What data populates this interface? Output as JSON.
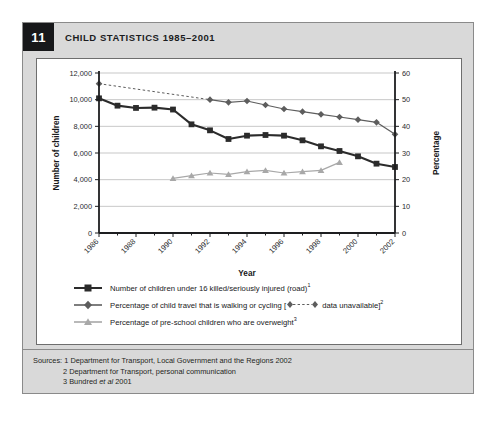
{
  "figure": {
    "number": "11",
    "title": "CHILD STATISTICS 1985–2001"
  },
  "chart_data": {
    "type": "line",
    "title": "",
    "xlabel": "Year",
    "ylabel": "Number of children",
    "y2label": "Percentage",
    "x": [
      1986,
      1987,
      1988,
      1989,
      1990,
      1991,
      1992,
      1993,
      1994,
      1995,
      1996,
      1997,
      1998,
      1999,
      2000,
      2001,
      2002
    ],
    "xlim": [
      1986,
      2002
    ],
    "xticks": [
      "1986",
      "1988",
      "1990",
      "1992",
      "1994",
      "1996",
      "1998",
      "2000",
      "2002"
    ],
    "xtick_values": [
      1986,
      1988,
      1990,
      1992,
      1994,
      1996,
      1998,
      2000,
      2002
    ],
    "ylim": [
      0,
      12000
    ],
    "yticks": [
      "0",
      "2,000",
      "4,000",
      "6,000",
      "8,000",
      "10,000",
      "12,000"
    ],
    "ytick_values": [
      0,
      2000,
      4000,
      6000,
      8000,
      10000,
      12000
    ],
    "y2lim": [
      0,
      60
    ],
    "y2ticks": [
      "0",
      "10",
      "20",
      "30",
      "40",
      "50",
      "60"
    ],
    "y2tick_values": [
      0,
      10,
      20,
      30,
      40,
      50,
      60
    ],
    "grid": "horizontal",
    "legend_position": "below",
    "series": [
      {
        "name": "Number of children under 16 killed/seriously injured (road)",
        "footnote": "1",
        "axis": "left",
        "color": "#2b2b2b",
        "marker": "square",
        "linestyle": "solid",
        "x": [
          1986,
          1987,
          1988,
          1989,
          1990,
          1991,
          1992,
          1993,
          1994,
          1995,
          1996,
          1997,
          1998,
          1999,
          2000,
          2001,
          2002
        ],
        "values": [
          10100,
          9550,
          9380,
          9400,
          9260,
          8150,
          7700,
          7050,
          7300,
          7350,
          7300,
          6950,
          6500,
          6150,
          5750,
          5200,
          4950
        ]
      },
      {
        "name": "Percentage of child travel that is walking or cycling",
        "footnote": "2",
        "bracket_note": "data unavailable",
        "axis": "right",
        "color": "#5d5d5d",
        "marker": "diamond",
        "linestyle": "solid",
        "dashed_from": 1986,
        "dashed_to": 1992,
        "x": [
          1986,
          1992,
          1993,
          1994,
          1995,
          1996,
          1997,
          1998,
          1999,
          2000,
          2001,
          2002
        ],
        "values": [
          56.0,
          50.0,
          49.0,
          49.5,
          48.0,
          46.5,
          45.5,
          44.5,
          43.5,
          42.5,
          41.5,
          37.0
        ]
      },
      {
        "name": "Percentage of pre-school children who are overweight",
        "footnote": "3",
        "axis": "right",
        "color": "#a8a8a8",
        "marker": "triangle",
        "linestyle": "solid",
        "x": [
          1990,
          1991,
          1992,
          1993,
          1994,
          1995,
          1996,
          1997,
          1998,
          1999
        ],
        "values": [
          20.5,
          21.5,
          22.5,
          22.0,
          23.0,
          23.5,
          22.5,
          23.0,
          23.5,
          26.5
        ]
      }
    ]
  },
  "legend": [
    {
      "label": "Number of children under 16 killed/seriously injured (road)",
      "footnote": "1",
      "marker": "square",
      "color": "#2b2b2b"
    },
    {
      "label": "Percentage of child travel that is walking or cycling [",
      "label_tail": " data unavailable]",
      "footnote": "2",
      "marker": "diamond",
      "color": "#5d5d5d"
    },
    {
      "label": "Percentage of pre-school children who are overweight",
      "footnote": "3",
      "marker": "triangle",
      "color": "#a8a8a8"
    }
  ],
  "sources": {
    "prefix": "Sources:",
    "items": [
      "1 Department for Transport, Local Government and the Regions 2002",
      "2 Department for Transport, personal communication"
    ],
    "item3_pre": "3 Bundred ",
    "item3_italic": "et al",
    "item3_post": " 2001"
  }
}
